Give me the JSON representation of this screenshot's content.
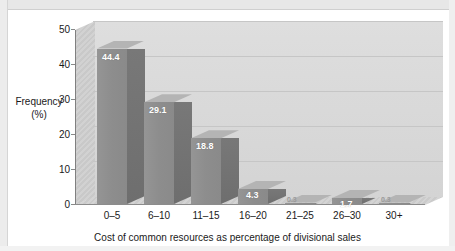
{
  "chart_data": {
    "type": "bar",
    "title": "",
    "subtitle": "",
    "categories": [
      "0–5",
      "6–10",
      "11–15",
      "16–20",
      "21–25",
      "26–30",
      "30+"
    ],
    "values": [
      44.4,
      29.1,
      18.8,
      4.3,
      0.3,
      1.7,
      0.3
    ],
    "data_labels": [
      "44.4",
      "29.1",
      "18.8",
      "4.3",
      "0.3",
      "1.7",
      "0.3"
    ],
    "xlabel": "Cost of common resources as percentage of divisional sales",
    "ylabel_line1": "Frequency",
    "ylabel_line2": "(%)",
    "ylim": [
      0,
      50
    ],
    "yticks": [
      0,
      10,
      20,
      30,
      40,
      50
    ],
    "ytick_labels": [
      "0",
      "10",
      "20",
      "30",
      "40",
      "50"
    ],
    "grid": true,
    "grid_axis": "y",
    "legend": false,
    "legend_position": "none",
    "style": "3d-bar",
    "colors": {
      "bar_front": "#8d8d8d",
      "bar_top": "#b4b4b4",
      "bar_side": "#707070",
      "plot_background": "#dadada",
      "gridline": "#c6c6c6",
      "axis": "#808080",
      "label_text": "#1a1a1a",
      "data_label_text": "#ffffff",
      "page_background": "#ffffff"
    }
  }
}
